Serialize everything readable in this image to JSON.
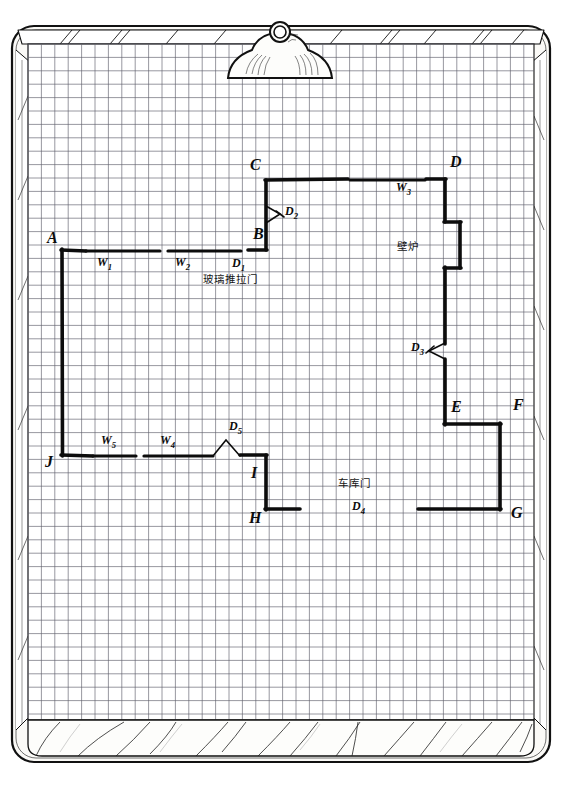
{
  "document": {
    "medium": "clipboard-with-graph-paper",
    "drawing_type": "hand-drawn architectural floor plan",
    "ink_color": "#101010",
    "grid_color": "#5a5a66",
    "paper_color": "#ffffff",
    "board_color": "#f5f4f0"
  },
  "labels": {
    "vertices": [
      {
        "id": "A",
        "text": "A",
        "x": 47,
        "y": 243
      },
      {
        "id": "B",
        "text": "B",
        "x": 253,
        "y": 239
      },
      {
        "id": "C",
        "text": "C",
        "x": 250,
        "y": 170
      },
      {
        "id": "D",
        "text": "D",
        "x": 450,
        "y": 167
      },
      {
        "id": "E",
        "text": "E",
        "x": 451,
        "y": 412
      },
      {
        "id": "F",
        "text": "F",
        "x": 513,
        "y": 410
      },
      {
        "id": "G",
        "text": "G",
        "x": 511,
        "y": 518
      },
      {
        "id": "H",
        "text": "H",
        "x": 249,
        "y": 523
      },
      {
        "id": "I",
        "text": "I",
        "x": 251,
        "y": 478
      },
      {
        "id": "J",
        "text": "J",
        "x": 45,
        "y": 467
      }
    ],
    "windows": [
      {
        "id": "W1",
        "text": "W",
        "sub": "1",
        "x": 97,
        "y": 266
      },
      {
        "id": "W2",
        "text": "W",
        "sub": "2",
        "x": 175,
        "y": 266
      },
      {
        "id": "W3",
        "text": "W",
        "sub": "3",
        "x": 396,
        "y": 191
      },
      {
        "id": "W4",
        "text": "W",
        "sub": "4",
        "x": 160,
        "y": 444
      },
      {
        "id": "W5",
        "text": "W",
        "sub": "5",
        "x": 101,
        "y": 444
      }
    ],
    "doors": [
      {
        "id": "D1",
        "text": "D",
        "sub": "1",
        "x": 232,
        "y": 267
      },
      {
        "id": "D2",
        "text": "D",
        "sub": "2",
        "x": 285,
        "y": 215
      },
      {
        "id": "D3",
        "text": "D",
        "sub": "3",
        "x": 411,
        "y": 351
      },
      {
        "id": "D4",
        "text": "D",
        "sub": "4",
        "x": 352,
        "y": 510
      },
      {
        "id": "D5",
        "text": "D",
        "sub": "5",
        "x": 229,
        "y": 430
      }
    ],
    "annotations": [
      {
        "id": "glass-sliding-door",
        "text": "玻璃推拉门",
        "x": 203,
        "y": 283
      },
      {
        "id": "fireplace",
        "text": "壁炉",
        "x": 397,
        "y": 250
      },
      {
        "id": "garage-door",
        "text": "车库门",
        "x": 338,
        "y": 487
      }
    ]
  },
  "plan_geometry": {
    "walls_solid": [
      {
        "name": "left-wall-A-J",
        "points": "62,250 62,455"
      },
      {
        "name": "top-wall-C-D",
        "points": "266,180 445,180"
      },
      {
        "name": "wall-B-C",
        "points": "266,180 266,250"
      },
      {
        "name": "wall-D-fireplace-top",
        "points": "445,180 445,222"
      },
      {
        "name": "fireplace-bump-top",
        "points": "445,222 460,222"
      },
      {
        "name": "fireplace-bump-right",
        "points": "460,222 460,268"
      },
      {
        "name": "fireplace-bump-bottom",
        "points": "460,268 445,268"
      },
      {
        "name": "wall-fireplace-to-D3",
        "points": "445,268 445,343"
      },
      {
        "name": "wall-D3-to-E",
        "points": "445,360 445,424"
      },
      {
        "name": "wall-E-F",
        "points": "445,424 500,424"
      },
      {
        "name": "wall-F-G",
        "points": "500,424 500,509"
      },
      {
        "name": "wall-J-bottom-stub",
        "points": "62,455 92,455"
      },
      {
        "name": "wall-I-H",
        "points": "266,455 266,509"
      },
      {
        "name": "wall-H-stub",
        "points": "266,509 300,509"
      },
      {
        "name": "wall-G-stub",
        "points": "418,509 500,509"
      },
      {
        "name": "wall-D5-to-I",
        "points": "240,455 266,455"
      },
      {
        "name": "wall-A-stub",
        "points": "62,250 85,250"
      },
      {
        "name": "wall-D1-to-B",
        "points": "248,250 266,250"
      }
    ],
    "walls_window_segments": [
      {
        "name": "W1-segment",
        "points": "85,251 160,251"
      },
      {
        "name": "W2-segment",
        "points": "168,251 240,251"
      },
      {
        "name": "W3-segment",
        "points": "350,181 425,181"
      },
      {
        "name": "W5-segment",
        "points": "92,456 135,456"
      },
      {
        "name": "W4-segment",
        "points": "143,456 212,456"
      }
    ],
    "door_markers": [
      {
        "name": "D1-marker",
        "type": "gap",
        "x": 240,
        "y": 251,
        "w": 8
      },
      {
        "name": "D2-marker",
        "type": "swing-arrow",
        "x": 266,
        "y": 215
      },
      {
        "name": "D3-marker",
        "type": "swing-arrow",
        "x": 445,
        "y": 351
      },
      {
        "name": "D4-marker",
        "type": "gap",
        "x": 300,
        "y": 509,
        "w": 118
      },
      {
        "name": "D5-marker",
        "type": "swing-arrow",
        "x": 225,
        "y": 455
      }
    ]
  },
  "clipboard": {
    "clip_label": "clip",
    "board_edge": "rounded wooden clipboard with hatched bevel"
  }
}
